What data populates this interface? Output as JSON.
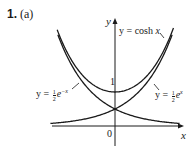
{
  "problem": {
    "number": "1.",
    "part": "(a)"
  },
  "axes": {
    "x_label": "x",
    "y_label": "y",
    "origin_label": "0",
    "y_tick_label": "1"
  },
  "curve_labels": {
    "cosh": {
      "prefix": "y = cosh ",
      "var": "x"
    },
    "left": {
      "prefix": "y = ",
      "num": "1",
      "den": "2",
      "base": "e",
      "exp": "−x"
    },
    "right": {
      "prefix": "y = ",
      "num": "1",
      "den": "2",
      "base": "e",
      "exp": "x"
    }
  },
  "colors": {
    "curve": "#1a1a1a",
    "axis": "#1a1a1a",
    "background": "#ffffff"
  },
  "chart_data": {
    "type": "line",
    "title": "1. (a)",
    "xlabel": "x",
    "ylabel": "y",
    "xlim": [
      -1.85,
      2.0
    ],
    "ylim": [
      -0.6,
      3.1
    ],
    "grid": false,
    "legend": "inline annotations",
    "y_ticks": [
      1
    ],
    "annotations": [
      "y = cosh x",
      "y = ½e^(−x)",
      "y = ½e^x",
      "0",
      "1"
    ],
    "series": [
      {
        "name": "y = cosh x",
        "x": [
          -1.7,
          -1.5,
          -1.0,
          -0.5,
          0,
          0.5,
          1.0,
          1.5,
          1.7
        ],
        "values": [
          2.83,
          2.35,
          1.54,
          1.13,
          1.0,
          1.13,
          1.54,
          2.35,
          2.83
        ]
      },
      {
        "name": "y = ½e^(−x)",
        "x": [
          -1.7,
          -1.5,
          -1.0,
          -0.5,
          0,
          0.5,
          1.0,
          1.5,
          1.8
        ],
        "values": [
          2.74,
          2.24,
          1.36,
          0.82,
          0.5,
          0.3,
          0.18,
          0.11,
          0.08
        ]
      },
      {
        "name": "y = ½e^x",
        "x": [
          -1.8,
          -1.5,
          -1.0,
          -0.5,
          0,
          0.5,
          1.0,
          1.5,
          1.7
        ],
        "values": [
          0.08,
          0.11,
          0.18,
          0.3,
          0.5,
          0.82,
          1.36,
          2.24,
          2.74
        ]
      }
    ]
  }
}
